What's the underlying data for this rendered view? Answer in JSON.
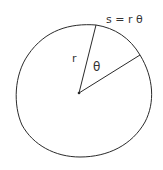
{
  "diagram": {
    "labels": {
      "arc_length": "s = r θ",
      "radius": "r",
      "angle": "θ"
    },
    "colors": {
      "stroke": "#2a2a2a",
      "background": "#ffffff"
    }
  }
}
